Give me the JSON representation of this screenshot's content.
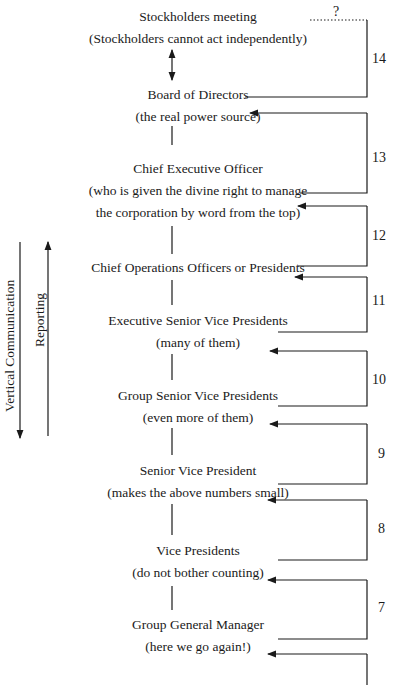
{
  "nodes": [
    {
      "title": "Stockholders meeting",
      "note": "(Stockholders cannot act independently)"
    },
    {
      "title": "Board of Directors",
      "note": "(the real power source)"
    },
    {
      "title": "Chief Executive Officer",
      "note": "(who is given the divine right to manage",
      "note2": "the corporation by word from the top)"
    },
    {
      "title": "Chief Operations Officers or Presidents"
    },
    {
      "title": "Executive Senior Vice Presidents",
      "note": "(many of them)"
    },
    {
      "title": "Group Senior Vice Presidents",
      "note": "(even more of them)"
    },
    {
      "title": "Senior Vice President",
      "note": "(makes the above numbers small)"
    },
    {
      "title": "Vice Presidents",
      "note": "(do not bother counting)"
    },
    {
      "title": "Group General Manager",
      "note": "(here we go again!)"
    }
  ],
  "brackets": [
    "14",
    "13",
    "12",
    "11",
    "10",
    "9",
    "8",
    "7"
  ],
  "question_mark": "?",
  "side_labels": {
    "vertical_communication": "Vertical Communication",
    "reporting": "Reporting"
  }
}
